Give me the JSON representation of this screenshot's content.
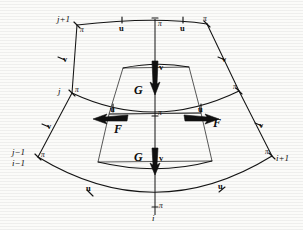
{
  "figure": {
    "background_color": "#fbfbf9",
    "ink_color": "#141414"
  },
  "index_labels": {
    "top_left": "j+1",
    "mid_left": "j",
    "bottom_left_upper": "j−1",
    "bottom_left_lower": "i−1",
    "bottom_right": "i+1",
    "bottom_center": "i"
  },
  "point_labels": {
    "pi": "π",
    "u": "u",
    "v": "v",
    "F": "F",
    "G": "G"
  },
  "pi_points": [
    {
      "id": "pi-top-left",
      "label": "π",
      "x": 77,
      "y": 25
    },
    {
      "id": "pi-top-center",
      "label": "π",
      "x": 155,
      "y": 24
    },
    {
      "id": "pi-top-right",
      "label": "π",
      "x": 207,
      "y": 24
    },
    {
      "id": "pi-mid-left",
      "label": "π",
      "x": 72,
      "y": 93
    },
    {
      "id": "pi-mid-center",
      "label": "π",
      "x": 155,
      "y": 115
    },
    {
      "id": "pi-mid-right",
      "label": "π",
      "x": 239,
      "y": 91
    },
    {
      "id": "pi-bot-left",
      "label": "π",
      "x": 38,
      "y": 157
    },
    {
      "id": "pi-bot-center",
      "label": "π",
      "x": 155,
      "y": 207
    },
    {
      "id": "pi-bot-right",
      "label": "π",
      "x": 272,
      "y": 156
    }
  ],
  "u_points": [
    {
      "id": "u-top-left",
      "label": "u",
      "x": 122,
      "y": 27
    },
    {
      "id": "u-top-right",
      "label": "u",
      "x": 183,
      "y": 27
    },
    {
      "id": "u-mid-left",
      "label": "u",
      "x": 113,
      "y": 110
    },
    {
      "id": "u-mid-right",
      "label": "u",
      "x": 201,
      "y": 110
    },
    {
      "id": "u-bot-left",
      "label": "u",
      "x": 89,
      "y": 191
    },
    {
      "id": "u-bot-right",
      "label": "u",
      "x": 221,
      "y": 190
    }
  ],
  "v_points": [
    {
      "id": "v-left-upper",
      "label": "v",
      "x": 62,
      "y": 58
    },
    {
      "id": "v-right-upper",
      "label": "v",
      "x": 221,
      "y": 57
    },
    {
      "id": "v-left-lower",
      "label": "v",
      "x": 46,
      "y": 125
    },
    {
      "id": "v-right-lower",
      "label": "v",
      "x": 258,
      "y": 124
    },
    {
      "id": "v-center-upper",
      "label": "v",
      "x": 159,
      "y": 66
    },
    {
      "id": "v-center-lower",
      "label": "v",
      "x": 159,
      "y": 157
    }
  ],
  "flux_arrows": [
    {
      "id": "F-left",
      "label": "F",
      "direction": "left",
      "x": 107,
      "y": 120
    },
    {
      "id": "F-right",
      "label": "F",
      "direction": "right",
      "x": 206,
      "y": 120
    },
    {
      "id": "G-upper",
      "label": "G",
      "direction": "up",
      "x": 140,
      "y": 89
    },
    {
      "id": "G-lower",
      "label": "G",
      "direction": "up",
      "x": 140,
      "y": 158
    }
  ]
}
